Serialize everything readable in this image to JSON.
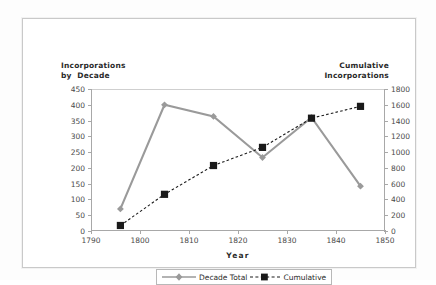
{
  "chart_data": {
    "type": "line",
    "title": "",
    "xlabel": "Year",
    "ylabel": "Incorporations by Decade",
    "ylabel_right": "Cumulative Incorporations",
    "x": [
      1796,
      1805,
      1815,
      1825,
      1835,
      1845
    ],
    "xlim": [
      1790,
      1850
    ],
    "ylim": [
      0,
      450
    ],
    "ylim_right": [
      0,
      1800
    ],
    "xticks": [
      "1790",
      "1800",
      "1810",
      "1820",
      "1830",
      "1840",
      "1850"
    ],
    "yticks_left": [
      "0",
      "50",
      "100",
      "150",
      "200",
      "250",
      "300",
      "350",
      "400",
      "450"
    ],
    "yticks_right": [
      "0",
      "200",
      "400",
      "600",
      "800",
      "1000",
      "1200",
      "1400",
      "1600",
      "1800"
    ],
    "grid": false,
    "legend_position": "bottom",
    "series": [
      {
        "name": "Decade Total",
        "axis": "left",
        "color": "#9a9a9a",
        "style": "solid",
        "marker": "diamond",
        "values": [
          70,
          400,
          363,
          233,
          360,
          142
        ]
      },
      {
        "name": "Cumulative",
        "axis": "right",
        "color": "#1a1a1a",
        "style": "dashed",
        "marker": "square",
        "values": [
          70,
          465,
          830,
          1060,
          1430,
          1580
        ]
      }
    ]
  },
  "axis_titles": {
    "left_line1": "Incorporations",
    "left_line2": "by  Decade",
    "right_line1": "Cumulative",
    "right_line2": "Incorporations"
  },
  "x_axis": {
    "label": "Year",
    "ticks": [
      "1790",
      "1800",
      "1810",
      "1820",
      "1830",
      "1840",
      "1850"
    ]
  },
  "y_axis_left": {
    "ticks": [
      "450",
      "400",
      "350",
      "300",
      "250",
      "200",
      "150",
      "100",
      "50",
      "0"
    ]
  },
  "y_axis_right": {
    "ticks": [
      "1800",
      "1600",
      "1400",
      "1200",
      "1000",
      "800",
      "600",
      "400",
      "200",
      "0"
    ]
  },
  "legend": {
    "items": [
      {
        "label": "Decade Total",
        "color": "#9a9a9a"
      },
      {
        "label": "Cumulative",
        "color": "#1a1a1a"
      }
    ]
  },
  "colors": {
    "decade_total": "#9a9a9a",
    "cumulative": "#1a1a1a",
    "axis": "#a8a8a8",
    "frame": "#c9c9c9"
  }
}
